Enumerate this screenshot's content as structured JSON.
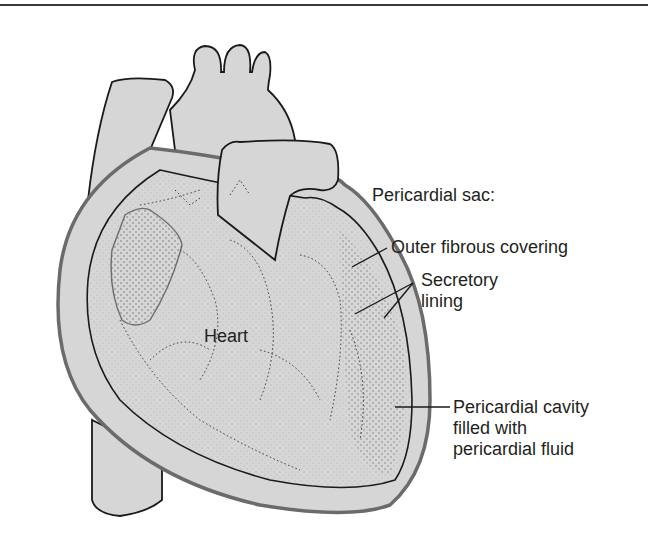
{
  "diagram": {
    "colors": {
      "fill": "#d6d6d6",
      "outline": "#1a1a1a",
      "sac_edge": "#6b6b6b",
      "text": "#231f20",
      "rule": "#3a3a3a"
    },
    "labels": {
      "heart": "Heart",
      "pericardial_sac": "Pericardial sac:",
      "outer_fibrous": "Outer fibrous covering",
      "secretory_line1": "Secretory",
      "secretory_line2": "lining",
      "cavity_line1": "Pericardial cavity",
      "cavity_line2": "filled with",
      "cavity_line3": "pericardial fluid"
    }
  }
}
